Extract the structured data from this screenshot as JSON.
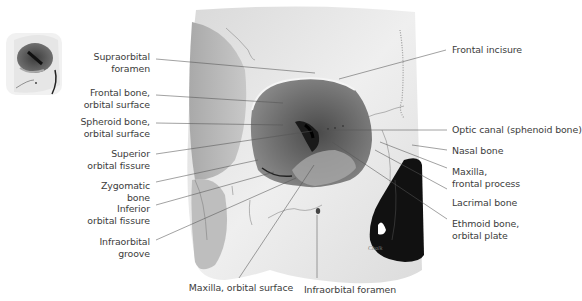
{
  "figure": {
    "type": "anatomical-illustration",
    "signature": "Chalk"
  },
  "labels_left": [
    {
      "id": "supraorbital-foramen",
      "line1": "Supraorbital",
      "line2": "foramen"
    },
    {
      "id": "frontal-bone-orbital-surface",
      "line1": "Frontal bone,",
      "line2": "orbital surface"
    },
    {
      "id": "sphenoid-bone-orbital-surface",
      "line1": "Spheroid bone,",
      "line2": "orbital surface"
    },
    {
      "id": "superior-orbital-fissure",
      "line1": "Superior",
      "line2": "orbital fissure"
    },
    {
      "id": "zygomatic-bone",
      "line1": "Zygomatic",
      "line2": "bone"
    },
    {
      "id": "inferior-orbital-fissure",
      "line1": "Inferior",
      "line2": "orbital fissure"
    },
    {
      "id": "infraorbital-groove",
      "line1": "Infraorbital",
      "line2": "groove"
    }
  ],
  "labels_right": [
    {
      "id": "frontal-incisure",
      "line1": "Frontal incisure",
      "line2": ""
    },
    {
      "id": "optic-canal",
      "line1": "Optic canal (sphenoid bone)",
      "line2": ""
    },
    {
      "id": "nasal-bone",
      "line1": "Nasal bone",
      "line2": ""
    },
    {
      "id": "maxilla-frontal-process",
      "line1": "Maxilla,",
      "line2": "frontal process"
    },
    {
      "id": "lacrimal-bone",
      "line1": "Lacrimal bone",
      "line2": ""
    },
    {
      "id": "ethmoid-bone-orbital-plate",
      "line1": "Ethmoid bone,",
      "line2": "orbital plate"
    }
  ],
  "labels_bottom": [
    {
      "id": "maxilla-orbital-surface",
      "line1": "Maxilla, orbital surface"
    },
    {
      "id": "infraorbital-foramen",
      "line1": "Infraorbital foramen"
    }
  ],
  "colors": {
    "bone": "#e9e9e9",
    "bone_shadow": "#bdbdbd",
    "orbit": "#6d6d6d",
    "orbit_dark": "#2a2a2a",
    "nasal_cavity": "#121212",
    "leader": "#555555",
    "text": "#3c3c3c"
  }
}
